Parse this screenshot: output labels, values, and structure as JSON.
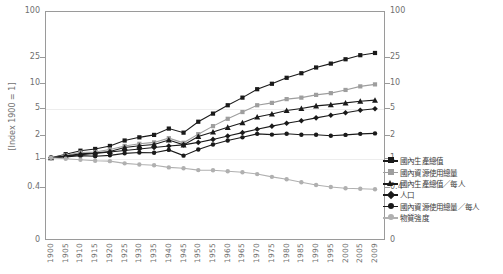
{
  "chart": {
    "title": "1900-2009年",
    "ylabel": "[Index 1900 = 1]"
  },
  "chart_data": {
    "type": "line",
    "title": "1900-2009年",
    "xlabel": "",
    "ylabel": "[Index 1900 = 1]",
    "yscale": "log",
    "ylim": [
      0.33,
      100
    ],
    "ytick_labels": [
      "100",
      "25",
      "10",
      "5",
      "2",
      "1",
      "0.4",
      "0"
    ],
    "ytick_values": [
      100,
      25,
      10,
      5,
      2,
      1,
      0.4,
      0
    ],
    "right_axis": true,
    "right_ytick_labels": [
      "100",
      "25",
      "10",
      "5",
      "2",
      "1",
      "0.4",
      "0"
    ],
    "grid": "horizontal-faint",
    "legend_position": "right",
    "x": [
      1900,
      1905,
      1910,
      1915,
      1920,
      1925,
      1930,
      1935,
      1940,
      1945,
      1950,
      1955,
      1960,
      1965,
      1970,
      1975,
      1980,
      1985,
      1990,
      1995,
      2000,
      2005,
      2009
    ],
    "xtick_labels": [
      "1900",
      "1905",
      "1910",
      "1915",
      "1920",
      "1925",
      "1930",
      "1935",
      "1940",
      "1945",
      "1950",
      "1955",
      "1960",
      "1965",
      "1970",
      "1975",
      "1980",
      "1985",
      "1990",
      "1995",
      "2000",
      "2005",
      "2009"
    ],
    "series": [
      {
        "name": "國內生產總值",
        "marker": "square",
        "color": "#1a1a1a",
        "values": [
          1.0,
          1.12,
          1.25,
          1.32,
          1.45,
          1.72,
          1.9,
          2.05,
          2.5,
          2.2,
          3.1,
          4.0,
          5.2,
          6.6,
          8.6,
          10.2,
          12.3,
          14.2,
          17.0,
          19.2,
          22.0,
          25.0,
          26.8
        ]
      },
      {
        "name": "國內資源使用總量",
        "marker": "square",
        "color": "#9e9e9e",
        "values": [
          1.0,
          1.08,
          1.18,
          1.2,
          1.3,
          1.45,
          1.55,
          1.62,
          1.85,
          1.6,
          2.1,
          2.7,
          3.4,
          4.2,
          5.2,
          5.6,
          6.3,
          6.6,
          7.2,
          7.6,
          8.4,
          9.4,
          10.0
        ]
      },
      {
        "name": "國內生產總值／每人",
        "marker": "triangle",
        "color": "#1a1a1a",
        "values": [
          1.0,
          1.06,
          1.13,
          1.16,
          1.22,
          1.38,
          1.46,
          1.52,
          1.75,
          1.5,
          1.95,
          2.25,
          2.6,
          3.0,
          3.6,
          3.95,
          4.4,
          4.7,
          5.1,
          5.3,
          5.6,
          5.9,
          6.1
        ]
      },
      {
        "name": "人口",
        "marker": "diamond",
        "color": "#1a1a1a",
        "values": [
          1.0,
          1.05,
          1.1,
          1.15,
          1.2,
          1.26,
          1.32,
          1.38,
          1.45,
          1.5,
          1.62,
          1.78,
          1.98,
          2.2,
          2.45,
          2.7,
          2.95,
          3.2,
          3.5,
          3.8,
          4.1,
          4.45,
          4.65
        ]
      },
      {
        "name": "國內資源使用總量／每人",
        "marker": "circle",
        "color": "#1a1a1a",
        "values": [
          1.0,
          1.03,
          1.07,
          1.05,
          1.08,
          1.15,
          1.18,
          1.17,
          1.28,
          1.07,
          1.3,
          1.52,
          1.72,
          1.9,
          2.12,
          2.07,
          2.13,
          2.06,
          2.06,
          2.0,
          2.05,
          2.12,
          2.15
        ]
      },
      {
        "name": "物質強度",
        "marker": "circle",
        "color": "#b0b0b0",
        "values": [
          1.0,
          0.97,
          0.94,
          0.91,
          0.9,
          0.84,
          0.81,
          0.79,
          0.74,
          0.72,
          0.68,
          0.675,
          0.655,
          0.635,
          0.6,
          0.55,
          0.51,
          0.465,
          0.425,
          0.4,
          0.385,
          0.378,
          0.373
        ]
      }
    ]
  }
}
